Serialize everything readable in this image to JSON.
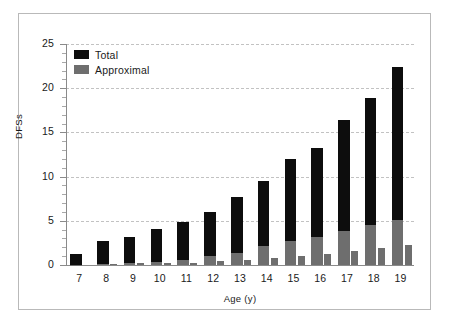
{
  "chart_data": {
    "type": "bar",
    "title": "",
    "subtitle": "",
    "xlabel": "Age (y)",
    "ylabel": "DFSs",
    "categories": [
      "7",
      "8",
      "9",
      "10",
      "11",
      "12",
      "13",
      "14",
      "15",
      "16",
      "17",
      "18",
      "19"
    ],
    "ylim": [
      0,
      25
    ],
    "yticks": [
      0,
      5,
      10,
      15,
      20,
      25
    ],
    "ytick_labels": [
      "0",
      "5",
      "10",
      "15",
      "20",
      "25"
    ],
    "grid": "horizontal-dashed",
    "legend_position": "top-left",
    "series": [
      {
        "name": "Total",
        "color": "#0d0d0d",
        "values": [
          1.3,
          2.7,
          3.2,
          4.1,
          4.9,
          6.0,
          7.7,
          9.5,
          12.0,
          13.2,
          16.4,
          18.9,
          22.4
        ]
      },
      {
        "name": "Approximal",
        "color": "#6e6e6e",
        "values": [
          0.05,
          0.1,
          0.2,
          0.35,
          0.6,
          1.0,
          1.4,
          2.1,
          2.7,
          3.2,
          3.9,
          4.5,
          5.1
        ]
      },
      {
        "name": "Approximal (adjacent bar)",
        "color": "#6e6e6e",
        "values": [
          0.0,
          0.1,
          0.2,
          0.2,
          0.25,
          0.4,
          0.6,
          0.8,
          1.0,
          1.2,
          1.6,
          1.9,
          2.3
        ]
      }
    ]
  },
  "legend": {
    "items": [
      {
        "label": "Total",
        "color": "#0d0d0d",
        "swatch": "black-square-swatch"
      },
      {
        "label": "Approximal",
        "color": "#6e6e6e",
        "swatch": "gray-square-swatch"
      }
    ]
  },
  "axes": {
    "y_label": "DFSs",
    "x_label": "Age (y)",
    "y_ticks": [
      "0",
      "5",
      "10",
      "15",
      "20",
      "25"
    ],
    "x_ticks": [
      "7",
      "8",
      "9",
      "10",
      "11",
      "12",
      "13",
      "14",
      "15",
      "16",
      "17",
      "18",
      "19"
    ]
  },
  "colors": {
    "total": "#0d0d0d",
    "approximal": "#6e6e6e",
    "grid": "#c2c2c2",
    "axis": "#8a8a8a",
    "frame": "#b9b9b9",
    "background": "#ffffff",
    "text": "#1a1a1a"
  }
}
